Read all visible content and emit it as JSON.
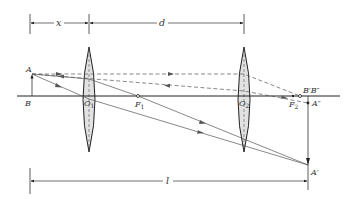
{
  "diagram": {
    "type": "two-lens optical system ray diagram",
    "colors": {
      "line": "#333333",
      "ray": "#555555",
      "lens_fill": "#e2e2e2",
      "lens_stroke": "#222222",
      "background": "#ffffff"
    },
    "dimensions": {
      "x_label": "x",
      "d_label": "d",
      "l_label": "l"
    },
    "object": {
      "top_label": "A",
      "base_label": "B"
    },
    "lenses": [
      {
        "name": "lens-1",
        "center_label": "O",
        "center_sub": "1",
        "focus_label": "F",
        "focus_sub": "1"
      },
      {
        "name": "lens-2",
        "center_label": "O",
        "center_sub": "2",
        "focus_label": "F",
        "focus_sub": "2"
      }
    ],
    "images": {
      "intermediate_base_label": "B′B″",
      "intermediate_top_label": "A″",
      "final_top_label": "A′"
    }
  }
}
